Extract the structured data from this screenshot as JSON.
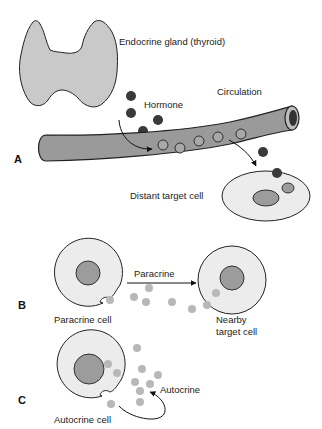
{
  "figure": {
    "panels": {
      "A": {
        "label": "A",
        "gland_label": "Endocrine gland (thyroid)",
        "hormone_label": "Hormone",
        "circulation_label": "Circulation",
        "target_label": "Distant target cell"
      },
      "B": {
        "label": "B",
        "arrow_label": "Paracrine",
        "source_label": "Paracrine cell",
        "target_label_line1": "Nearby",
        "target_label_line2": "target cell"
      },
      "C": {
        "label": "C",
        "arrow_label": "Autocrine",
        "source_label": "Autocrine cell"
      }
    },
    "colors": {
      "gland_fill": "#c9c9c9",
      "vessel_fill": "#9a9a9a",
      "hormone_dark": "#3a3a3a",
      "cell_fill": "#ececec",
      "nucleus_fill": "#9c9c9c",
      "signal_light": "#b8b8b8",
      "outline": "#222222"
    }
  }
}
